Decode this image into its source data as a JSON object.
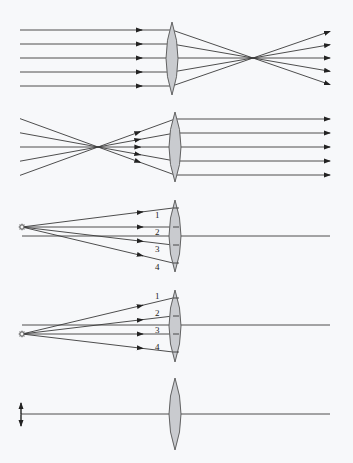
{
  "diagram": {
    "colors": {
      "ray": "#3a3a3a",
      "highlight_ray": "#d9534f",
      "lens_fill": "#c9cbcf",
      "lens_stroke": "#555555",
      "background": "#f7f8fa"
    },
    "panels": [
      {
        "id": "parallel-in-converge",
        "lens": {
          "x": 172,
          "top": 22,
          "bottom": 95,
          "halfwidth": 6
        },
        "focus": {
          "x": 253,
          "y": 58
        },
        "rays": [
          {
            "y": 30,
            "color": "#3a3a3a",
            "out_end": [
              330,
              30
            ]
          },
          {
            "y": 44,
            "color": "#d9534f",
            "out_end": [
              330,
              44
            ]
          },
          {
            "y": 58,
            "color": "#3a3a3a",
            "out_end": [
              330,
              58
            ]
          },
          {
            "y": 72,
            "color": "#3a3a3a",
            "out_end": [
              330,
              72
            ]
          },
          {
            "y": 86,
            "color": "#3a3a3a",
            "out_end": [
              330,
              86
            ]
          }
        ],
        "start_x": 20,
        "arrow_x": 142
      },
      {
        "id": "focus-in-parallel",
        "lens": {
          "x": 175,
          "top": 112,
          "bottom": 182,
          "halfwidth": 6
        },
        "focus": {
          "x": 98,
          "y": 147
        },
        "rays": [
          {
            "y": 119,
            "start": [
              20,
              119
            ]
          },
          {
            "y": 133,
            "start": [
              20,
              133
            ]
          },
          {
            "y": 147,
            "start": [
              20,
              147
            ]
          },
          {
            "y": 161,
            "start": [
              20,
              161
            ]
          },
          {
            "y": 175,
            "start": [
              20,
              175
            ]
          }
        ],
        "end_x": 330
      },
      {
        "id": "point-source-near",
        "source": {
          "x": 22,
          "y": 227
        },
        "axis_y": 236,
        "axis_start": 22,
        "axis_end": 330,
        "lens": {
          "x": 175,
          "top": 200,
          "bottom": 272,
          "halfwidth": 6
        },
        "rays": [
          {
            "label": "1",
            "end": [
              173,
              208
            ],
            "label_pos": [
              155,
              218
            ]
          },
          {
            "label": "2",
            "end": [
              173,
              227
            ],
            "label_pos": [
              155,
              235
            ]
          },
          {
            "label": "3",
            "end": [
              173,
              245
            ],
            "label_pos": [
              155,
              252
            ]
          },
          {
            "label": "4",
            "end": [
              173,
              263
            ],
            "label_pos": [
              155,
              270
            ]
          }
        ]
      },
      {
        "id": "point-source-off-axis",
        "source": {
          "x": 22,
          "y": 334
        },
        "axis_y": 325,
        "axis_start": 22,
        "axis_end": 330,
        "lens": {
          "x": 175,
          "top": 290,
          "bottom": 362,
          "halfwidth": 6
        },
        "rays": [
          {
            "label": "1",
            "end": [
              173,
              298
            ],
            "label_pos": [
              155,
              299
            ]
          },
          {
            "label": "2",
            "end": [
              173,
              316
            ],
            "label_pos": [
              155,
              316
            ]
          },
          {
            "label": "3",
            "end": [
              173,
              334
            ],
            "label_pos": [
              155,
              333
            ]
          },
          {
            "label": "4",
            "end": [
              173,
              352
            ],
            "label_pos": [
              155,
              350
            ]
          }
        ]
      },
      {
        "id": "object-arrow",
        "object": {
          "x": 21,
          "top": 403,
          "bottom": 426
        },
        "axis_y": 414,
        "axis_start": 21,
        "axis_end": 330,
        "lens": {
          "x": 175,
          "top": 378,
          "bottom": 450,
          "halfwidth": 6
        }
      }
    ]
  }
}
